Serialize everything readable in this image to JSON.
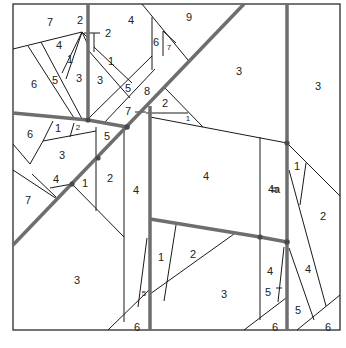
{
  "diagram": {
    "type": "foundation paper-piecing pattern",
    "colors": {
      "line": "#1a1a1a",
      "seam": "#6e6e6e",
      "background": "#ffffff"
    },
    "labels": [
      {
        "text": "7",
        "x": 50,
        "y": 22
      },
      {
        "text": "2",
        "x": 80,
        "y": 20
      },
      {
        "text": "2",
        "x": 108,
        "y": 33
      },
      {
        "text": "4",
        "x": 131,
        "y": 20
      },
      {
        "text": "9",
        "x": 189,
        "y": 17
      },
      {
        "text": "4",
        "x": 59,
        "y": 45
      },
      {
        "text": "1",
        "x": 70,
        "y": 59
      },
      {
        "text": "6",
        "x": 156,
        "y": 42
      },
      {
        "text": "7",
        "x": 169,
        "y": 47,
        "small": true
      },
      {
        "text": "1",
        "x": 111,
        "y": 61
      },
      {
        "text": "6",
        "x": 34,
        "y": 84
      },
      {
        "text": "5",
        "x": 55,
        "y": 80
      },
      {
        "text": "3",
        "x": 79,
        "y": 78
      },
      {
        "text": "3",
        "x": 100,
        "y": 80
      },
      {
        "text": "5",
        "x": 128,
        "y": 88
      },
      {
        "text": "8",
        "x": 147,
        "y": 91
      },
      {
        "text": "3",
        "x": 239,
        "y": 71
      },
      {
        "text": "3",
        "x": 318,
        "y": 86
      },
      {
        "text": "7",
        "x": 128,
        "y": 111
      },
      {
        "text": "2",
        "x": 165,
        "y": 103
      },
      {
        "text": "1",
        "x": 188,
        "y": 118,
        "small": true
      },
      {
        "text": "6",
        "x": 30,
        "y": 134
      },
      {
        "text": "1",
        "x": 58,
        "y": 128
      },
      {
        "text": "2",
        "x": 78,
        "y": 127,
        "small": true
      },
      {
        "text": "5",
        "x": 107,
        "y": 136
      },
      {
        "text": "3",
        "x": 62,
        "y": 155
      },
      {
        "text": "4",
        "x": 206,
        "y": 176
      },
      {
        "text": "4a",
        "x": 274,
        "y": 189
      },
      {
        "text": "1",
        "x": 297,
        "y": 166
      },
      {
        "text": "2",
        "x": 110,
        "y": 178
      },
      {
        "text": "4",
        "x": 56,
        "y": 179
      },
      {
        "text": "1",
        "x": 85,
        "y": 183
      },
      {
        "text": "4",
        "x": 136,
        "y": 190
      },
      {
        "text": "2",
        "x": 323,
        "y": 216
      },
      {
        "text": "7",
        "x": 28,
        "y": 200
      },
      {
        "text": "1",
        "x": 161,
        "y": 257
      },
      {
        "text": "2",
        "x": 193,
        "y": 254
      },
      {
        "text": "4",
        "x": 270,
        "y": 271
      },
      {
        "text": "4",
        "x": 308,
        "y": 269
      },
      {
        "text": "3",
        "x": 77,
        "y": 280
      },
      {
        "text": "3",
        "x": 224,
        "y": 294
      },
      {
        "text": "5",
        "x": 268,
        "y": 292
      },
      {
        "text": "5",
        "x": 144,
        "y": 293,
        "small": true
      },
      {
        "text": "5",
        "x": 298,
        "y": 310
      },
      {
        "text": "6",
        "x": 137,
        "y": 327
      },
      {
        "text": "6",
        "x": 275,
        "y": 327
      },
      {
        "text": "6",
        "x": 328,
        "y": 327
      }
    ]
  }
}
